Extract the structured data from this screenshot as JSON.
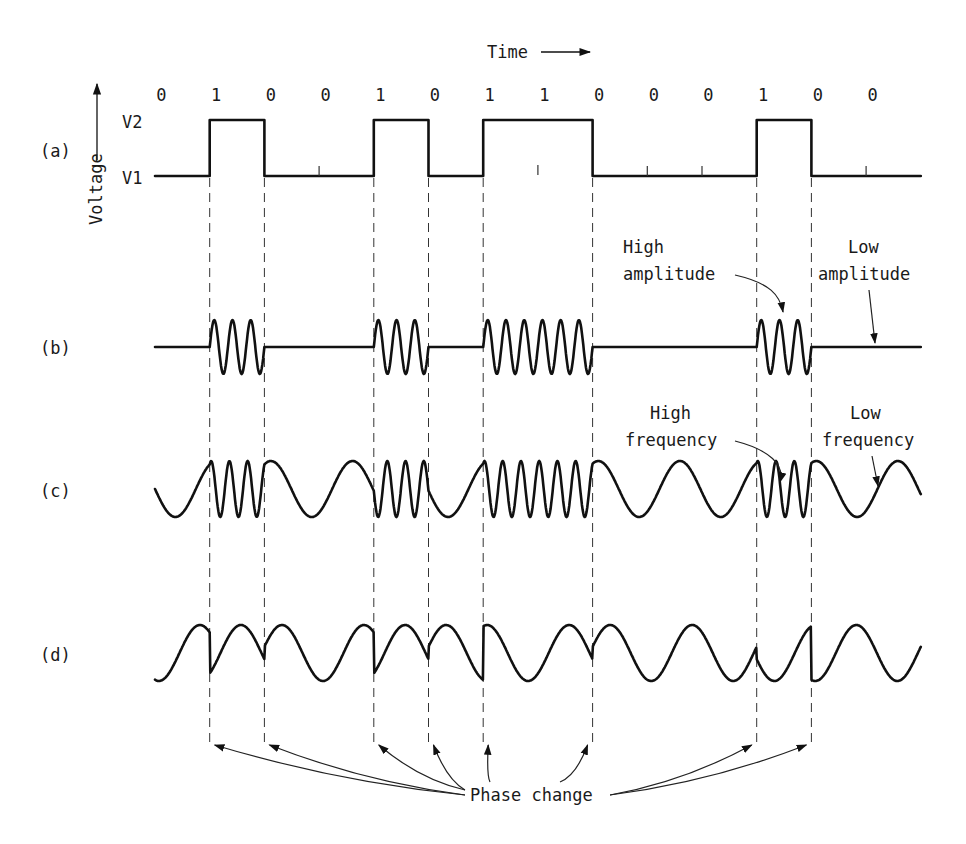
{
  "diagram": {
    "time_label": "Time",
    "voltage_label": "Voltage",
    "levels": {
      "high": "V2",
      "low": "V1"
    },
    "bits": [
      "0",
      "1",
      "0",
      "0",
      "1",
      "0",
      "1",
      "1",
      "0",
      "0",
      "0",
      "1",
      "0",
      "0"
    ],
    "rows": [
      {
        "id": "a",
        "label": "(a)",
        "description": "binary signal"
      },
      {
        "id": "b",
        "label": "(b)",
        "description": "amplitude modulation"
      },
      {
        "id": "c",
        "label": "(c)",
        "description": "frequency modulation"
      },
      {
        "id": "d",
        "label": "(d)",
        "description": "phase modulation"
      }
    ],
    "annotations": {
      "high_amplitude": [
        "High",
        "amplitude"
      ],
      "low_amplitude": [
        "Low",
        "amplitude"
      ],
      "high_frequency": [
        "High",
        "frequency"
      ],
      "low_frequency": [
        "Low",
        "frequency"
      ],
      "phase_change": "Phase change"
    },
    "colors": {
      "ink": "#111111",
      "background": "#ffffff"
    }
  }
}
